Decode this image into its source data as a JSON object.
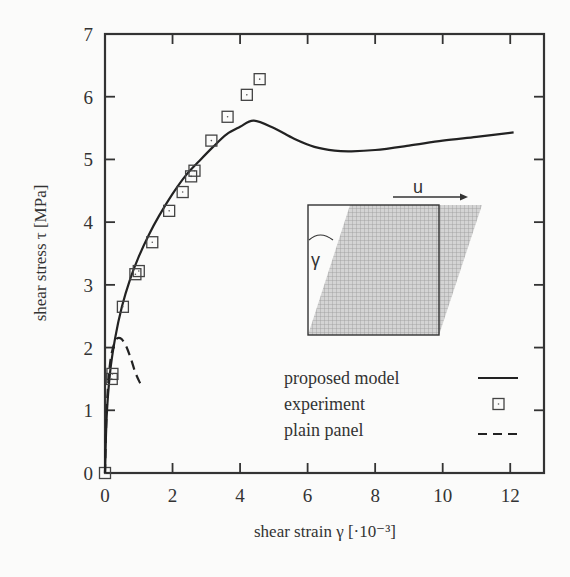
{
  "chart_data": {
    "type": "line",
    "title": "",
    "xlabel": "shear strain γ [·10⁻³]",
    "ylabel": "shear stress τ [MPa]",
    "xlim": [
      0,
      13
    ],
    "ylim": [
      0,
      7
    ],
    "xticks": [
      0,
      2,
      4,
      6,
      8,
      10,
      12
    ],
    "yticks": [
      0,
      1,
      2,
      3,
      4,
      5,
      6,
      7
    ],
    "grid": false,
    "legend_position": "lower right",
    "series": [
      {
        "name": "proposed model",
        "style": "solid",
        "x": [
          0,
          0.05,
          0.15,
          0.3,
          0.5,
          0.75,
          1.0,
          1.3,
          1.6,
          2.0,
          2.4,
          2.8,
          3.2,
          3.6,
          4.0,
          4.4,
          5.0,
          5.6,
          6.2,
          6.8,
          7.3,
          8.0,
          9.0,
          10.0,
          11.0,
          12.1
        ],
        "y": [
          0,
          0.9,
          1.6,
          2.15,
          2.65,
          3.1,
          3.45,
          3.8,
          4.1,
          4.45,
          4.75,
          4.98,
          5.2,
          5.4,
          5.52,
          5.62,
          5.5,
          5.33,
          5.2,
          5.14,
          5.13,
          5.15,
          5.22,
          5.3,
          5.36,
          5.43
        ]
      },
      {
        "name": "experiment",
        "style": "marker-square",
        "x": [
          0,
          0.2,
          0.22,
          0.53,
          0.9,
          1.0,
          1.4,
          1.9,
          2.3,
          2.55,
          2.65,
          3.15,
          3.63,
          4.2,
          4.58
        ],
        "y": [
          0,
          1.5,
          1.58,
          2.65,
          3.17,
          3.22,
          3.68,
          4.18,
          4.48,
          4.73,
          4.82,
          5.3,
          5.68,
          6.03,
          6.28
        ]
      },
      {
        "name": "plain panel",
        "style": "dashed",
        "x": [
          0,
          0.05,
          0.15,
          0.3,
          0.45,
          0.6,
          0.75,
          0.9,
          1.05
        ],
        "y": [
          0,
          1.0,
          1.75,
          2.1,
          2.15,
          2.05,
          1.85,
          1.6,
          1.42
        ]
      }
    ],
    "legend": [
      {
        "label": "proposed model",
        "symbol": "solid-line"
      },
      {
        "label": "experiment",
        "symbol": "square"
      },
      {
        "label": "plain panel",
        "symbol": "dashed-line"
      }
    ],
    "inset": {
      "description": "square panel sheared into parallelogram",
      "displacement_label": "u",
      "angle_label": "γ"
    }
  },
  "colors": {
    "line": "#222222",
    "axis": "#333333",
    "hatch_fill": "#bdbdbd",
    "background": "#fbfbfa"
  }
}
